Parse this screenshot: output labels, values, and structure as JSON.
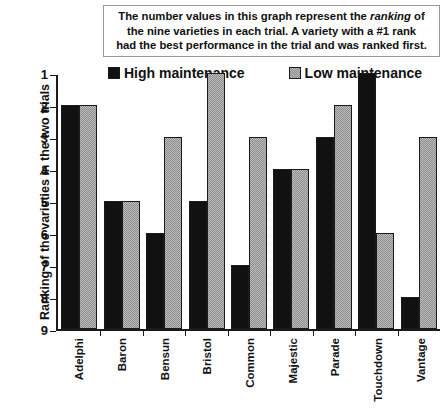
{
  "caption": {
    "line1_pre": "The number values in this graph represent the ",
    "line1_em": "ranking",
    "line1_post": " of",
    "line2": "the nine varieties in each trial.  A variety with a #1 rank",
    "line3": "had the best performance in the trial and was ranked first."
  },
  "legend": {
    "high_label": "High maintenance",
    "low_label": "Low maintenance",
    "high_color": "#111111",
    "low_color": "#bdbdbd"
  },
  "chart_data": {
    "type": "bar",
    "title": "",
    "xlabel": "",
    "ylabel": "Ranking of the varieties in the two trials",
    "ylim": [
      1,
      9
    ],
    "y_inverted": true,
    "grid": false,
    "legend_position": "top",
    "yticks": [
      "1",
      "2",
      "3",
      "4",
      "5",
      "6",
      "7",
      "8",
      "9"
    ],
    "categories": [
      "Adelphi",
      "Baron",
      "Bensun",
      "Bristol",
      "Common",
      "Majestic",
      "Parade",
      "Touchdown",
      "Vantage"
    ],
    "series": [
      {
        "name": "High maintenance",
        "color": "#111111",
        "values": [
          2,
          5,
          6,
          5,
          7,
          4,
          3,
          1,
          8
        ]
      },
      {
        "name": "Low maintenance",
        "color": "#bdbdbd",
        "values": [
          2,
          5,
          3,
          1,
          3,
          4,
          2,
          6,
          3
        ]
      }
    ]
  }
}
